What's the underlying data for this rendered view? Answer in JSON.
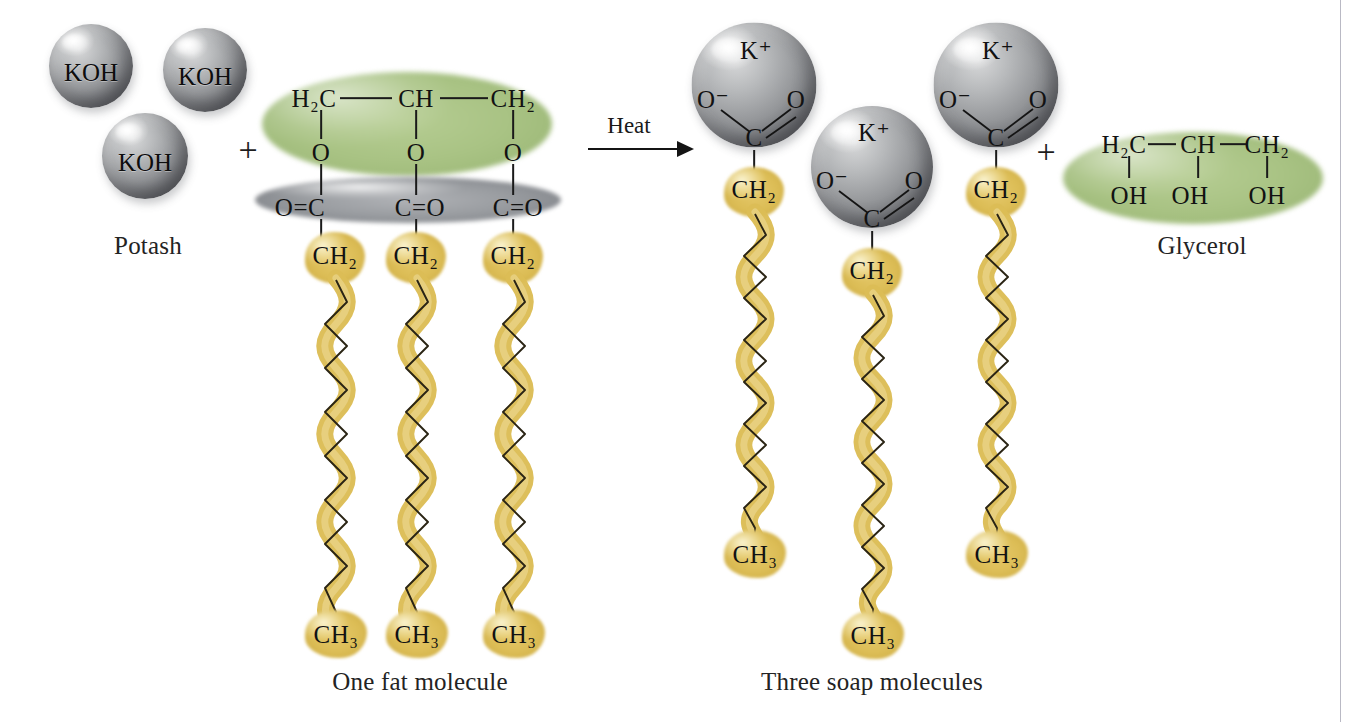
{
  "diagram": {
    "colors": {
      "background": "#ffffff",
      "sphere_gray": "#95979a",
      "glycerol_green": "#a9c384",
      "ester_gray": "#85888d",
      "fatty_chain_gold": "#dcbd56",
      "ink": "#141414",
      "page_edge": "#b9b9c4"
    }
  },
  "reactants": {
    "potash": {
      "caption": "Potash",
      "molecule_label": "KOH",
      "spheres": [
        {
          "label": "KOH"
        },
        {
          "label": "KOH"
        },
        {
          "label": "KOH"
        }
      ]
    },
    "plus_sign": "+",
    "fat": {
      "caption": "One fat molecule",
      "glycerol_backbone": [
        "H2C",
        "CH",
        "CH2"
      ],
      "glycerol_backbone_display": [
        "H₂C",
        "CH",
        "CH₂"
      ],
      "ester_oxygens": [
        "O",
        "O",
        "O"
      ],
      "carbonyls": [
        "O=C",
        "C=O",
        "C=O"
      ],
      "chain_head": "CH2",
      "chain_head_display": "CH₂",
      "chain_tail": "CH3",
      "chain_tail_display": "CH₃",
      "chain_count": 3
    }
  },
  "reaction": {
    "condition_label": "Heat",
    "arrow": "right-arrow"
  },
  "products": {
    "soap": {
      "caption": "Three soap molecules",
      "molecule_count": 3,
      "head": {
        "cation": "K+",
        "cation_display": "K⁺",
        "oxygen_anion": "O-",
        "oxygen_anion_display": "O⁻",
        "oxygen_double": "O",
        "carbon": "C"
      },
      "chain_head": "CH2",
      "chain_head_display": "CH₂",
      "chain_tail": "CH3",
      "chain_tail_display": "CH₃"
    },
    "plus_sign": "+",
    "glycerol": {
      "caption": "Glycerol",
      "backbone": [
        "H2C",
        "CH",
        "CH2"
      ],
      "backbone_display": [
        "H₂C",
        "CH",
        "CH₂"
      ],
      "hydroxyls": [
        "OH",
        "OH",
        "OH"
      ]
    }
  }
}
